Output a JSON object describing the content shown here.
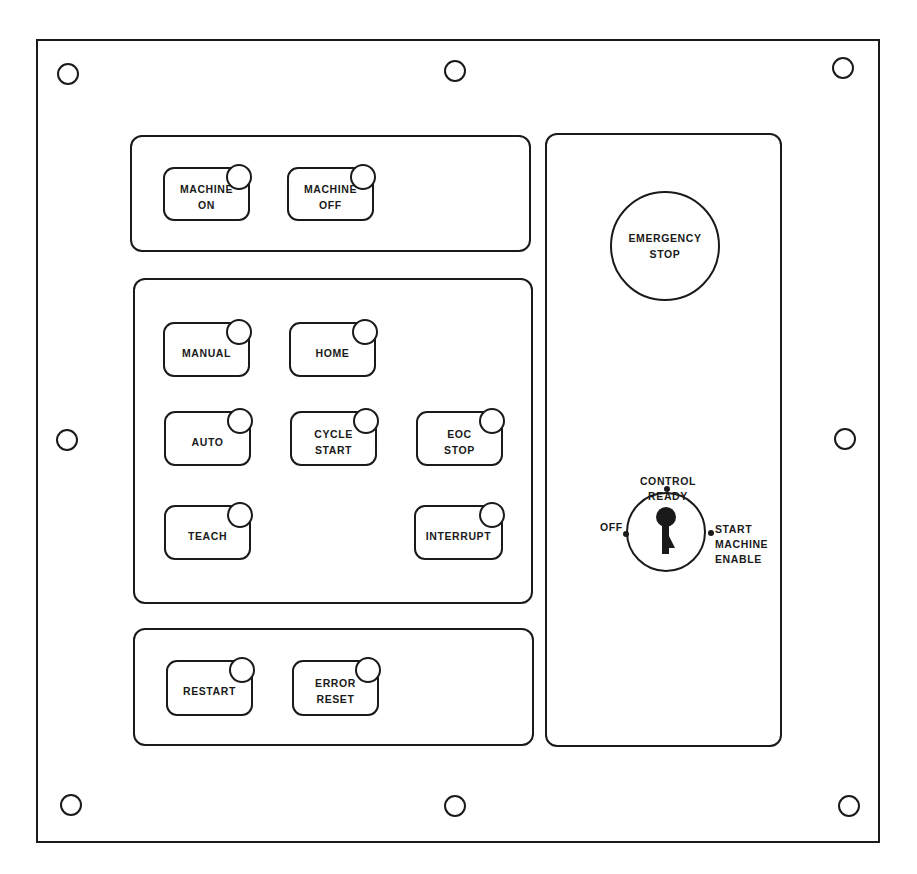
{
  "panel": {
    "colors": {
      "line": "#1a1a1a",
      "background": "#ffffff"
    },
    "mounting_holes": [
      {
        "x": 68,
        "y": 74
      },
      {
        "x": 455,
        "y": 71
      },
      {
        "x": 843,
        "y": 68
      },
      {
        "x": 67,
        "y": 440
      },
      {
        "x": 845,
        "y": 439
      },
      {
        "x": 71,
        "y": 805
      },
      {
        "x": 455,
        "y": 806
      },
      {
        "x": 849,
        "y": 806
      }
    ]
  },
  "power_group": {
    "buttons": [
      {
        "label": "MACHINE\nON",
        "indicator": "lamp"
      },
      {
        "label": "MACHINE\nOFF",
        "indicator": "lamp"
      }
    ]
  },
  "mode_group": {
    "buttons": [
      {
        "label": "MANUAL",
        "indicator": "lamp"
      },
      {
        "label": "HOME",
        "indicator": "lamp"
      },
      {
        "label": "AUTO",
        "indicator": "lamp"
      },
      {
        "label": "CYCLE\nSTART",
        "indicator": "lamp"
      },
      {
        "label": "EOC\nSTOP",
        "indicator": "lamp"
      },
      {
        "label": "TEACH",
        "indicator": "lamp"
      },
      {
        "label": "INTERRUPT",
        "indicator": "lamp"
      }
    ]
  },
  "reset_group": {
    "buttons": [
      {
        "label": "RESTART",
        "indicator": "lamp"
      },
      {
        "label": "ERROR\nRESET",
        "indicator": "lamp"
      }
    ]
  },
  "safety_panel": {
    "emergency_stop": {
      "label": "EMERGENCY\nSTOP"
    },
    "key_switch": {
      "icon": "key-icon",
      "positions": [
        {
          "label": "OFF"
        },
        {
          "label": "CONTROL\nREADY"
        },
        {
          "label": "START\nMACHINE\nENABLE"
        }
      ]
    }
  }
}
